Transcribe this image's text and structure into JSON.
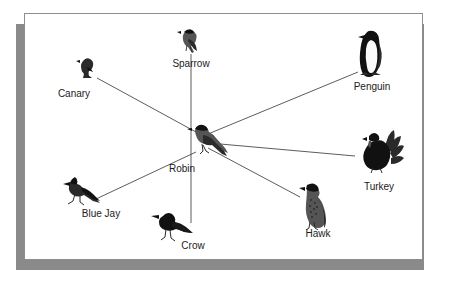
{
  "figure": {
    "kind": "semantic-network-diagram",
    "title": "",
    "frame": {
      "border_color": "#8d8d8d",
      "shadow_color": "#8a8a8a",
      "background": "#ffffff"
    },
    "line_color": "#4a4a4a",
    "label_color": "#1b1b1b"
  },
  "chart_data": {
    "type": "diagram",
    "title": "",
    "center": "Robin",
    "nodes": [
      {
        "id": "robin",
        "label": "Robin",
        "x": 205,
        "y": 140,
        "label_x": 182,
        "label_y": 163,
        "icon": "robin-bird-icon"
      },
      {
        "id": "canary",
        "label": "Canary",
        "x": 88,
        "y": 70,
        "label_x": 74,
        "label_y": 88,
        "icon": "canary-bird-icon"
      },
      {
        "id": "sparrow",
        "label": "Sparrow",
        "x": 191,
        "y": 43,
        "label_x": 191,
        "label_y": 58,
        "icon": "sparrow-bird-icon"
      },
      {
        "id": "penguin",
        "label": "Penguin",
        "x": 372,
        "y": 56,
        "label_x": 372,
        "label_y": 81,
        "icon": "penguin-bird-icon"
      },
      {
        "id": "turkey",
        "label": "Turkey",
        "x": 380,
        "y": 152,
        "label_x": 379,
        "label_y": 181,
        "icon": "turkey-bird-icon"
      },
      {
        "id": "hawk",
        "label": "Hawk",
        "x": 313,
        "y": 207,
        "label_x": 318,
        "label_y": 228,
        "icon": "hawk-bird-icon"
      },
      {
        "id": "crow",
        "label": "Crow",
        "x": 172,
        "y": 228,
        "label_x": 193,
        "label_y": 240,
        "icon": "crow-bird-icon"
      },
      {
        "id": "bluejay",
        "label": "Blue Jay",
        "x": 82,
        "y": 194,
        "label_x": 101,
        "label_y": 208,
        "icon": "bluejay-bird-icon"
      }
    ],
    "edges": [
      {
        "from": "robin",
        "to": "canary",
        "x1": 196,
        "y1": 132,
        "x2": 97,
        "y2": 78
      },
      {
        "from": "robin",
        "to": "sparrow",
        "x1": 191,
        "y1": 156,
        "x2": 191,
        "y2": 54
      },
      {
        "from": "robin",
        "to": "penguin",
        "x1": 208,
        "y1": 134,
        "x2": 358,
        "y2": 72
      },
      {
        "from": "robin",
        "to": "turkey",
        "x1": 209,
        "y1": 143,
        "x2": 355,
        "y2": 156
      },
      {
        "from": "robin",
        "to": "hawk",
        "x1": 208,
        "y1": 148,
        "x2": 300,
        "y2": 197
      },
      {
        "from": "robin",
        "to": "crow",
        "x1": 191,
        "y1": 156,
        "x2": 191,
        "y2": 223
      },
      {
        "from": "robin",
        "to": "bluejay",
        "x1": 196,
        "y1": 152,
        "x2": 96,
        "y2": 199
      }
    ],
    "edge_count": 7,
    "node_count": 8
  }
}
